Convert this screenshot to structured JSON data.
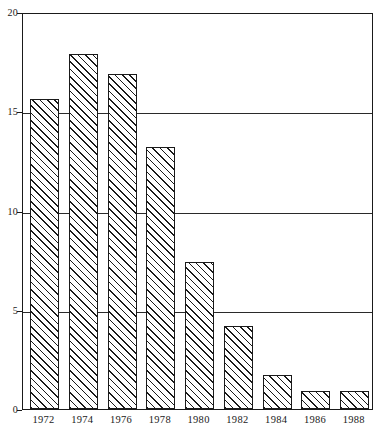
{
  "chart_data": {
    "type": "bar",
    "title": "",
    "subtitle": "",
    "xlabel": "",
    "ylabel": "",
    "categories": [
      "1972",
      "1974",
      "1976",
      "1978",
      "1980",
      "1982",
      "1984",
      "1986",
      "1988"
    ],
    "values": [
      15.6,
      17.9,
      16.9,
      13.2,
      7.4,
      4.2,
      1.7,
      0.9,
      0.9
    ],
    "ylim": [
      0,
      20
    ],
    "ytick_labels": [
      "0",
      "5",
      "10",
      "15",
      "20"
    ],
    "ytick_values": [
      0,
      5,
      10,
      15,
      20
    ],
    "gridline_values": [
      5,
      10,
      15
    ],
    "grid": true,
    "legend": "none",
    "bar_fill": "hatched-diagonal",
    "bar_edge_color": "#1a1a1a",
    "axis_color": "#1a1a1a",
    "background_color": "#ffffff"
  },
  "caption": {
    "partial_text": ""
  }
}
